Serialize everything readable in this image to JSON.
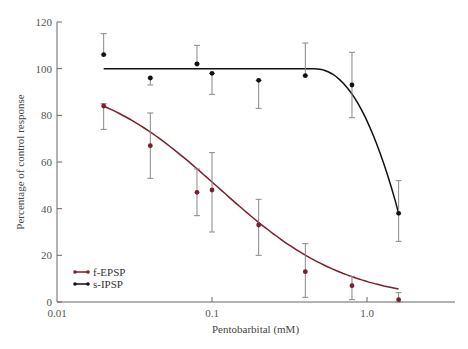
{
  "chart_data": {
    "type": "line",
    "title": "",
    "xlabel": "Pentobarbital (mM)",
    "ylabel": "Percentage of control response",
    "xscale": "log",
    "xlim": [
      0.01,
      4.0
    ],
    "ylim": [
      0,
      120
    ],
    "x_ticks": [
      "0.01",
      "0.1",
      "1.0"
    ],
    "y_ticks": [
      "0",
      "20",
      "40",
      "60",
      "80",
      "100",
      "120"
    ],
    "grid": false,
    "legend_position": "lower left",
    "series": [
      {
        "name": "f-EPSP",
        "color": "#7a1f2b",
        "x": [
          0.02,
          0.04,
          0.08,
          0.1,
          0.2,
          0.4,
          0.8,
          1.6
        ],
        "values": [
          84,
          67,
          47,
          48,
          33,
          13,
          7,
          1
        ],
        "error_low": [
          74,
          53,
          37,
          30,
          20,
          2,
          1,
          0
        ],
        "error_high": [
          85,
          81,
          57,
          64,
          44,
          25,
          11,
          4
        ]
      },
      {
        "name": "s-IPSP",
        "color": "#111111",
        "x": [
          0.02,
          0.04,
          0.08,
          0.1,
          0.2,
          0.4,
          0.8,
          1.6
        ],
        "values": [
          106,
          96,
          102,
          98,
          95,
          97,
          93,
          38
        ],
        "error_low": [
          106,
          93,
          102,
          89,
          83,
          97,
          79,
          26
        ],
        "error_high": [
          115,
          96,
          110,
          98,
          95,
          111,
          107,
          52
        ]
      }
    ]
  },
  "labels": {
    "xlabel": "Pentobarbital (mM)",
    "ylabel": "Percentage of control response",
    "legend": [
      "f-EPSP",
      "s-IPSP"
    ],
    "xticks": [
      "0.01",
      "0.1",
      "1.0"
    ],
    "yticks": [
      "0",
      "20",
      "40",
      "60",
      "80",
      "100",
      "120"
    ]
  }
}
